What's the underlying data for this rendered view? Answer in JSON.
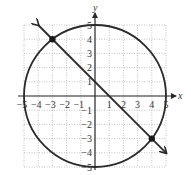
{
  "chart_data": {
    "type": "line",
    "title": "",
    "xlabel": "x",
    "ylabel": "y",
    "xlim": [
      -5,
      5
    ],
    "ylim": [
      -5,
      5
    ],
    "grid": true,
    "x_ticks": [
      "-5",
      "-4",
      "-3",
      "-2",
      "-1",
      "1",
      "2",
      "3",
      "4",
      "5"
    ],
    "y_ticks": [
      "5",
      "4",
      "3",
      "2",
      "1",
      "-1",
      "-2",
      "-3",
      "-4",
      "-5"
    ],
    "series": [
      {
        "name": "circle",
        "shape": "circle",
        "center": [
          0,
          0
        ],
        "radius": 5,
        "equation": "x^2 + y^2 = 25"
      },
      {
        "name": "line",
        "shape": "line",
        "equation": "y = -x + 1",
        "x": [
          -4,
          5
        ],
        "y": [
          5,
          -4
        ],
        "arrows": true
      }
    ],
    "points": [
      {
        "x": -3,
        "y": 4
      },
      {
        "x": 4,
        "y": -3
      }
    ]
  },
  "labels": {
    "x_axis": "x",
    "y_axis": "y"
  }
}
